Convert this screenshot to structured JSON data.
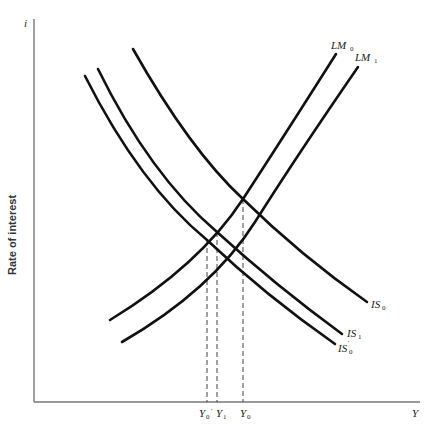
{
  "diagram": {
    "type": "IS-LM diagram",
    "axes": {
      "y_symbol": "i",
      "y_label": "Rate of interest",
      "x_symbol": "Y"
    },
    "curves": [
      {
        "id": "LM0",
        "base": "LM",
        "sub": "0"
      },
      {
        "id": "LM1",
        "base": "LM",
        "sub": "1"
      },
      {
        "id": "IS0",
        "base": "IS",
        "sub": "0"
      },
      {
        "id": "IS1",
        "base": "IS",
        "sub": "1"
      },
      {
        "id": "IS0prime",
        "base": "IS",
        "sub": "0",
        "prime": "′"
      }
    ],
    "x_ticks": [
      {
        "id": "Y0prime",
        "base": "Y",
        "sub": "0",
        "prime": "′"
      },
      {
        "id": "Y1",
        "base": "Y",
        "sub": "1"
      },
      {
        "id": "Y0",
        "base": "Y",
        "sub": "0"
      }
    ]
  }
}
